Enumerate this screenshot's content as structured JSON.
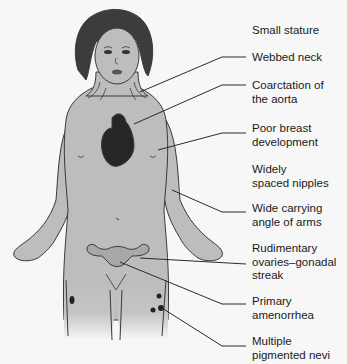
{
  "diagram": {
    "colors": {
      "background": "#f7f7f7",
      "skin": "#bdbdbd",
      "outline": "#3a3a3a",
      "hair": "#3c3c3c",
      "heart": "#262626",
      "leader_line": "#2a2a2a",
      "text": "#1a1a1a"
    },
    "labels": [
      {
        "id": "small-stature",
        "lines": [
          "Small stature"
        ]
      },
      {
        "id": "webbed-neck",
        "lines": [
          "Webbed neck"
        ]
      },
      {
        "id": "coarctation",
        "lines": [
          "Coarctation of",
          "the aorta"
        ]
      },
      {
        "id": "poor-breast",
        "lines": [
          "Poor breast",
          "development"
        ]
      },
      {
        "id": "widely-spaced-nipples",
        "lines": [
          "Widely",
          "spaced nipples"
        ]
      },
      {
        "id": "wide-carrying-angle",
        "lines": [
          "Wide carrying",
          "angle of arms"
        ]
      },
      {
        "id": "rudimentary-ovaries",
        "lines": [
          "Rudimentary",
          "ovaries–gonadal",
          "streak"
        ]
      },
      {
        "id": "primary-amenorrhea",
        "lines": [
          "Primary",
          "amenorrhea"
        ]
      },
      {
        "id": "pigmented-nevi",
        "lines": [
          "Multiple",
          "pigmented nevi"
        ]
      }
    ]
  }
}
